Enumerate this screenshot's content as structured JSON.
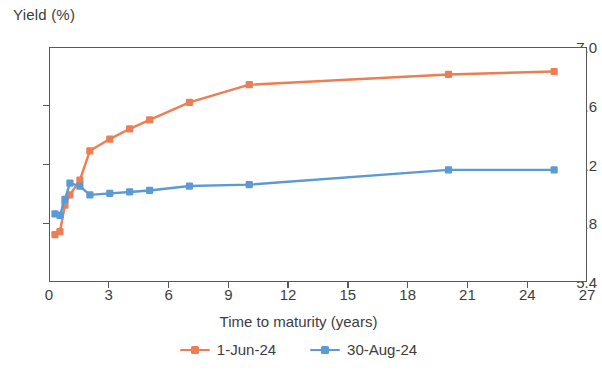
{
  "chart_data": {
    "type": "line",
    "title": "",
    "ylabel": "Yield (%)",
    "xlabel": "Time to maturity (years)",
    "xlim": [
      0,
      27
    ],
    "ylim": [
      5.4,
      7.0
    ],
    "xticks": [
      0,
      3,
      6,
      9,
      12,
      15,
      18,
      21,
      24,
      27
    ],
    "yticks": [
      5.4,
      5.8,
      6.2,
      6.6,
      7.0
    ],
    "ytick_labels": [
      "5.4",
      "5.8",
      "6.2",
      "6.6",
      "7.0"
    ],
    "xtick_labels": [
      "0",
      "3",
      "6",
      "9",
      "12",
      "15",
      "18",
      "21",
      "24",
      "27"
    ],
    "grid": false,
    "legend_position": "bottom",
    "markers": "square",
    "series": [
      {
        "name": "1-Jun-24",
        "color": "#ED7D52",
        "x": [
          0.25,
          0.5,
          0.75,
          1.0,
          1.5,
          2.0,
          3.0,
          4.0,
          5.0,
          7.0,
          10.0,
          20.0,
          25.3
        ],
        "y": [
          5.73,
          5.75,
          5.93,
          6.0,
          6.1,
          6.3,
          6.38,
          6.45,
          6.51,
          6.63,
          6.75,
          6.82,
          6.84
        ]
      },
      {
        "name": "30-Aug-24",
        "color": "#5B9BD5",
        "x": [
          0.25,
          0.5,
          0.75,
          1.0,
          1.5,
          2.0,
          3.0,
          4.0,
          5.0,
          7.0,
          10.0,
          20.0,
          25.3
        ],
        "y": [
          5.87,
          5.86,
          5.97,
          6.08,
          6.06,
          6.0,
          6.01,
          6.02,
          6.03,
          6.06,
          6.07,
          6.17,
          6.17
        ]
      }
    ]
  },
  "legend": {
    "items": [
      {
        "label": "1-Jun-24",
        "color": "#ED7D52"
      },
      {
        "label": "30-Aug-24",
        "color": "#5B9BD5"
      }
    ]
  }
}
